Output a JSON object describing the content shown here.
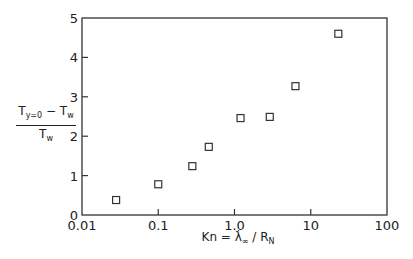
{
  "chart_data": {
    "type": "scatter",
    "title": "",
    "xlabel": "Kn = λ∞ / R_N",
    "ylabel": "(T_y=0 − T_w) / T_w",
    "xscale": "log",
    "xlim": [
      0.01,
      100
    ],
    "ylim": [
      0,
      5
    ],
    "x_ticks": [
      "0.01",
      "0.1",
      "1.0",
      "10",
      "100"
    ],
    "y_ticks": [
      "0",
      "1",
      "2",
      "3",
      "4",
      "5"
    ],
    "grid": false,
    "legend": null,
    "marker": "open-square",
    "series": [
      {
        "name": "data",
        "x": [
          0.028,
          0.1,
          0.28,
          0.46,
          1.2,
          2.9,
          6.3,
          23
        ],
        "y": [
          0.38,
          0.78,
          1.24,
          1.73,
          2.46,
          2.49,
          3.27,
          4.6
        ]
      }
    ]
  },
  "axes": {
    "x_tick_labels": [
      "0.01",
      "0.1",
      "1.0",
      "10",
      "100"
    ],
    "y_tick_labels": [
      "0",
      "1",
      "2",
      "3",
      "4",
      "5"
    ],
    "xlabel": {
      "lhs": "Kn = ",
      "lambda": "λ̇",
      "lambda_sub": "∞",
      "slash": " / R",
      "r_sub": "N"
    },
    "ylabel": {
      "num_T": "T",
      "num_sub": "y=0",
      "num_rest": " − T",
      "num_w": "w",
      "den_T": "T",
      "den_w": "w"
    }
  }
}
